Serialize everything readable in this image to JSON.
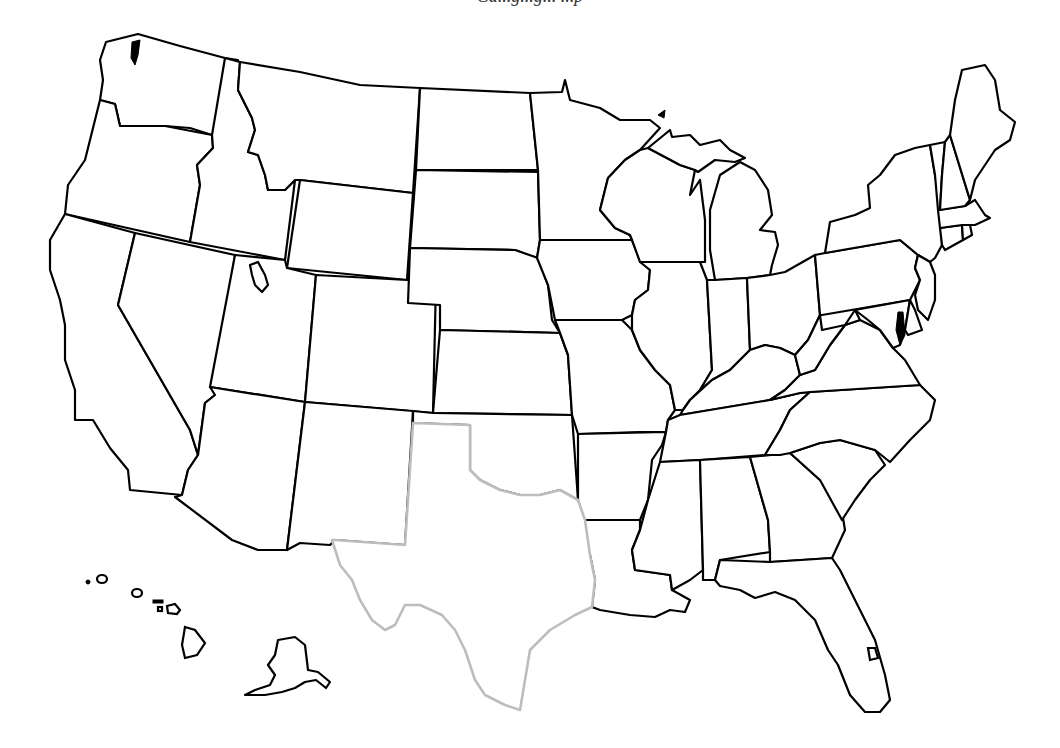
{
  "header": {
    "caption_partial": "Ca...g...g... ...p"
  },
  "map": {
    "title": "United States blank state outline map",
    "highlighted_state": "Texas",
    "colors": {
      "border": "#000000",
      "highlight_border": "#bdbdbd",
      "fill": "#ffffff",
      "background": "#ffffff"
    },
    "states": [
      "Washington",
      "Oregon",
      "California",
      "Idaho",
      "Nevada",
      "Montana",
      "Wyoming",
      "Utah",
      "Arizona",
      "Colorado",
      "New Mexico",
      "North Dakota",
      "South Dakota",
      "Nebraska",
      "Kansas",
      "Oklahoma",
      "Texas",
      "Minnesota",
      "Iowa",
      "Missouri",
      "Arkansas",
      "Louisiana",
      "Wisconsin",
      "Illinois",
      "Michigan",
      "Indiana",
      "Ohio",
      "Kentucky",
      "Tennessee",
      "Mississippi",
      "Alabama",
      "Georgia",
      "Florida",
      "South Carolina",
      "North Carolina",
      "Virginia",
      "West Virginia",
      "Pennsylvania",
      "New York",
      "Maryland",
      "Delaware",
      "New Jersey",
      "Connecticut",
      "Rhode Island",
      "Massachusetts",
      "Vermont",
      "New Hampshire",
      "Maine",
      "Alaska",
      "Hawaii"
    ]
  }
}
